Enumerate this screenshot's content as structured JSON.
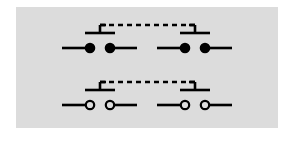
{
  "figure": {
    "panel": {
      "background_color": "#dcdcdc",
      "page_background_color": "#ffffff",
      "x": 16,
      "y": 7,
      "width": 262,
      "height": 121
    },
    "ink_color": "#000000",
    "line_width": 2.6,
    "rows": [
      {
        "id": "row-closed-contacts",
        "label": "Upper row: filled contact dots",
        "contact_style": "filled",
        "contact_radius": 4.2,
        "baseline_y": 48,
        "bar_y": 33,
        "link_y": 25,
        "switches": [
          {
            "id": "switch-top-left",
            "label": "Top left switch",
            "mirrored": false,
            "lead_left_x1": 62,
            "lead_left_x2": 86,
            "contact_a_x": 90,
            "contact_b_x": 110,
            "lead_right_x1": 114,
            "lead_right_x2": 137,
            "bar_x1": 85,
            "bar_x2": 115,
            "stem_x": 100
          },
          {
            "id": "switch-top-right",
            "label": "Top right switch",
            "mirrored": true,
            "lead_left_x1": 157,
            "lead_left_x2": 181,
            "contact_a_x": 185,
            "contact_b_x": 205,
            "lead_right_x1": 209,
            "lead_right_x2": 232,
            "bar_x1": 180,
            "bar_x2": 210,
            "stem_x": 195
          }
        ],
        "link": {
          "id": "mechanical-link-top",
          "label": "Dashed mechanical linkage (upper)",
          "x1": 100,
          "x2": 195,
          "y": 25,
          "dash_pattern": "5 4"
        }
      },
      {
        "id": "row-open-contacts",
        "label": "Lower row: open contact circles",
        "contact_style": "open",
        "contact_radius": 4.2,
        "baseline_y": 105,
        "bar_y": 90,
        "link_y": 82,
        "switches": [
          {
            "id": "switch-bottom-left",
            "label": "Bottom left switch",
            "mirrored": false,
            "lead_left_x1": 62,
            "lead_left_x2": 86,
            "contact_a_x": 90,
            "contact_b_x": 110,
            "lead_right_x1": 114,
            "lead_right_x2": 137,
            "bar_x1": 85,
            "bar_x2": 115,
            "stem_x": 100
          },
          {
            "id": "switch-bottom-right",
            "label": "Bottom right switch",
            "mirrored": true,
            "lead_left_x1": 157,
            "lead_left_x2": 181,
            "contact_a_x": 185,
            "contact_b_x": 205,
            "lead_right_x1": 209,
            "lead_right_x2": 232,
            "bar_x1": 180,
            "bar_x2": 210,
            "stem_x": 195
          }
        ],
        "link": {
          "id": "mechanical-link-bottom",
          "label": "Dashed mechanical linkage (lower)",
          "x1": 100,
          "x2": 195,
          "y": 82,
          "dash_pattern": "5 4"
        }
      }
    ]
  }
}
